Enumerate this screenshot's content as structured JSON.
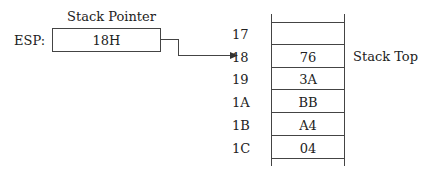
{
  "pointer": {
    "title": "Stack Pointer",
    "register_label": "ESP:",
    "value": "18H"
  },
  "stack": {
    "top_label": "Stack Top",
    "rows": [
      {
        "address": "17",
        "value": ""
      },
      {
        "address": "18",
        "value": "76"
      },
      {
        "address": "19",
        "value": "3A"
      },
      {
        "address": "1A",
        "value": "BB"
      },
      {
        "address": "1B",
        "value": "A4"
      },
      {
        "address": "1C",
        "value": "04"
      }
    ]
  }
}
